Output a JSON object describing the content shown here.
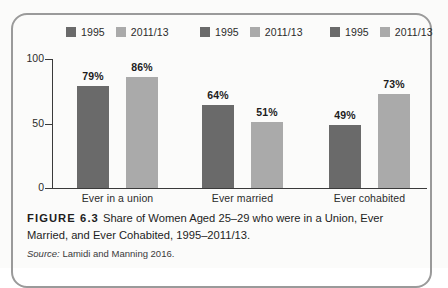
{
  "figure": {
    "number_label": "FIGURE 6.3",
    "caption_text": "Share of Women Aged 25–29 who were in a Union, Ever Married, and Ever Cohabited, 1995–2011/13.",
    "source_word": "Source:",
    "source_text": " Lamidi and Manning 2016."
  },
  "colors": {
    "series_1995": "#6a6a6a",
    "series_2011_13": "#aaaaaa",
    "axis": "#3a3a3a",
    "frame": "#9a9a9a",
    "text": "#1d1d1d",
    "page_background": "#fbfbfa"
  },
  "legend": {
    "groups": [
      {
        "entries": [
          {
            "label": "1995"
          },
          {
            "label": "2011/13"
          }
        ]
      },
      {
        "entries": [
          {
            "label": "1995"
          },
          {
            "label": "2011/13"
          }
        ]
      },
      {
        "entries": [
          {
            "label": "1995"
          },
          {
            "label": "2011/13"
          }
        ]
      }
    ]
  },
  "axis": {
    "y_ticks": [
      "100",
      "50",
      "0"
    ]
  },
  "chart_data": {
    "type": "bar",
    "title": "Share of Women Aged 25–29 who were in a Union, Ever Married, and Ever Cohabited, 1995–2011/13.",
    "xlabel": "",
    "ylabel": "",
    "ylim": [
      0,
      100
    ],
    "yticks": [
      0,
      50,
      100
    ],
    "grid": false,
    "legend_position": "top",
    "categories": [
      "Ever in a union",
      "Ever married",
      "Ever cohabited"
    ],
    "series": [
      {
        "name": "1995",
        "color": "#6a6a6a",
        "values": [
          79,
          86,
          64
        ],
        "value_labels": [
          "79%",
          "86%",
          "64%"
        ]
      },
      {
        "name": "2011/13",
        "color": "#aaaaaa",
        "values": [
          51,
          49,
          73
        ],
        "value_labels": [
          "51%",
          "49%",
          "73%"
        ]
      }
    ],
    "bars": [
      {
        "category": "Ever in a union",
        "series": "1995",
        "value": 79,
        "label": "79%",
        "color": "#6a6a6a"
      },
      {
        "category": "Ever in a union",
        "series": "2011/13",
        "value": 86,
        "label": "86%",
        "color": "#aaaaaa"
      },
      {
        "category": "Ever married",
        "series": "1995",
        "value": 64,
        "label": "64%",
        "color": "#6a6a6a"
      },
      {
        "category": "Ever married",
        "series": "2011/13",
        "value": 51,
        "label": "51%",
        "color": "#aaaaaa"
      },
      {
        "category": "Ever cohabited",
        "series": "1995",
        "value": 49,
        "label": "49%",
        "color": "#6a6a6a"
      },
      {
        "category": "Ever cohabited",
        "series": "2011/13",
        "value": 73,
        "label": "73%",
        "color": "#aaaaaa"
      }
    ]
  }
}
